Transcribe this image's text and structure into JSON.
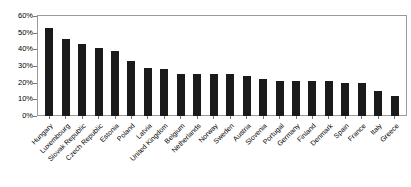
{
  "chart_data": {
    "type": "bar",
    "title": "",
    "subtitle": "",
    "xlabel": "",
    "ylabel": "",
    "ylim": [
      0,
      60
    ],
    "ytick_labels": [
      "60%",
      "50%",
      "40%",
      "30%",
      "20%",
      "10%",
      "0%"
    ],
    "ytick_values": [
      60,
      50,
      40,
      30,
      20,
      10,
      0
    ],
    "grid": false,
    "legend": false,
    "legend_position": "none",
    "bar_color": "#1a1a1a",
    "categories": [
      "Hungary",
      "Luxembourg",
      "Slovak Republic",
      "Czech Republic",
      "Estonia",
      "Poland",
      "Latvia",
      "United Kingdom",
      "Belgium",
      "Netherlands",
      "Norway",
      "Sweden",
      "Austria",
      "Slovenia",
      "Portugal",
      "Germany",
      "Finland",
      "Denmark",
      "Spain",
      "France",
      "Italy",
      "Greece"
    ],
    "values": [
      53,
      46,
      43,
      41,
      39,
      33,
      29,
      28,
      25,
      25,
      25,
      25,
      24,
      22,
      21,
      21,
      21,
      21,
      20,
      20,
      15,
      12
    ]
  }
}
